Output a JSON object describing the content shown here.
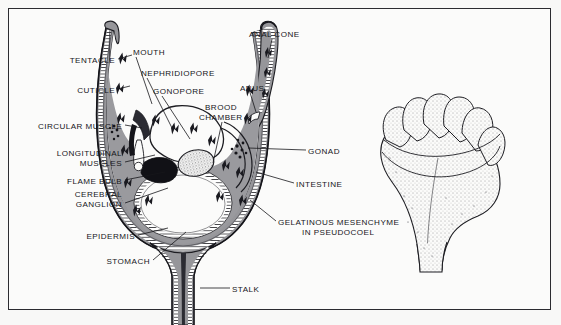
{
  "figure": {
    "background_color": "#f8f8f7",
    "frame_color": "#2b2b30",
    "ink_color": "#16161a"
  },
  "labels": [
    {
      "id": "tentacle",
      "text": "TENTACLE",
      "x": 115,
      "y": 61,
      "align": "right"
    },
    {
      "id": "cuticle",
      "text": "CUTICLE",
      "x": 115,
      "y": 91,
      "align": "right"
    },
    {
      "id": "circular_muscle",
      "text": "CIRCULAR MUSCLE",
      "x": 122,
      "y": 127,
      "align": "right"
    },
    {
      "id": "longitudinal_muscles_1",
      "text": "LONGITUDINAL",
      "x": 122,
      "y": 154,
      "align": "right"
    },
    {
      "id": "longitudinal_muscles_2",
      "text": "MUSCLES",
      "x": 122,
      "y": 164,
      "align": "right"
    },
    {
      "id": "flame_bulb",
      "text": "FLAME BULB",
      "x": 122,
      "y": 182,
      "align": "right"
    },
    {
      "id": "cerebral_ganglion_1",
      "text": "CEREBRAL",
      "x": 122,
      "y": 195,
      "align": "right"
    },
    {
      "id": "cerebral_ganglion_2",
      "text": "GANGLION",
      "x": 122,
      "y": 205,
      "align": "right"
    },
    {
      "id": "epidermis",
      "text": "EPIDERMIS",
      "x": 135,
      "y": 237,
      "align": "right"
    },
    {
      "id": "stomach",
      "text": "STOMACH",
      "x": 150,
      "y": 262,
      "align": "right"
    },
    {
      "id": "mouth",
      "text": "MOUTH",
      "x": 133,
      "y": 53,
      "align": "left"
    },
    {
      "id": "nephridiopore",
      "text": "NEPHRIDIOPORE",
      "x": 141,
      "y": 74,
      "align": "left"
    },
    {
      "id": "gonopore",
      "text": "GONOPORE",
      "x": 153,
      "y": 92,
      "align": "left"
    },
    {
      "id": "brood_chamber_1",
      "text": "BROOD",
      "x": 205,
      "y": 108,
      "align": "left"
    },
    {
      "id": "brood_chamber_2",
      "text": "CHAMBER",
      "x": 199,
      "y": 118,
      "align": "left"
    },
    {
      "id": "anal_cone",
      "text": "ANAL CONE",
      "x": 249,
      "y": 35,
      "align": "left"
    },
    {
      "id": "anus",
      "text": "ANUS",
      "x": 240,
      "y": 89,
      "align": "left"
    },
    {
      "id": "gonad",
      "text": "GONAD",
      "x": 308,
      "y": 152,
      "align": "left"
    },
    {
      "id": "intestine",
      "text": "INTESTINE",
      "x": 296,
      "y": 185,
      "align": "left"
    },
    {
      "id": "mesenchyme_1",
      "text": "GELATINOUS MESENCHYME",
      "x": 278,
      "y": 223,
      "align": "left"
    },
    {
      "id": "mesenchyme_2",
      "text": "IN PSEUDOCOEL",
      "x": 302,
      "y": 233,
      "align": "left"
    },
    {
      "id": "stalk",
      "text": "STALK",
      "x": 232,
      "y": 290,
      "align": "left"
    }
  ],
  "structures": {
    "section_view": "longitudinal section of calyx with tentacle crown, stalk",
    "external_view": "stippled external lateral view of entoproct calyx and stalk"
  }
}
